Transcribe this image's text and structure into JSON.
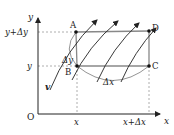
{
  "diagram": {
    "axes": {
      "x_label": "x",
      "y_label": "y",
      "origin_label": "O"
    },
    "ticks": {
      "x_tick": "x",
      "x_dx_tick": "x+Δx",
      "y_tick": "y",
      "y_dy_tick": "y+Δy"
    },
    "points": {
      "A": "A",
      "B": "B",
      "C": "C",
      "D": "D"
    },
    "arc_labels": {
      "delta_y": "Δy",
      "delta_x": "Δx"
    },
    "velocity_label": "v",
    "colors": {
      "line": "#222222",
      "rect_edge": "#888888",
      "dashed": "#999999",
      "point": "#111111"
    }
  }
}
